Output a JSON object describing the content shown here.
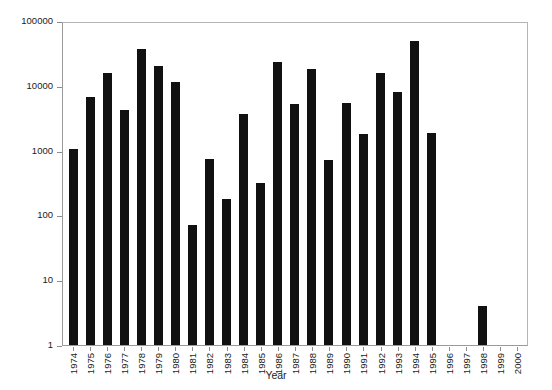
{
  "chart_data": {
    "type": "bar",
    "title": "",
    "xlabel": "Year",
    "ylabel": "Log total number collected",
    "yscale": "log",
    "ylim": [
      1,
      100000
    ],
    "ytick_labels": [
      "100000",
      "10000",
      "1000",
      "100",
      "10",
      "1"
    ],
    "ytick_values": [
      100000,
      10000,
      1000,
      100,
      10,
      1
    ],
    "grid": false,
    "legend": null,
    "bar_color": "#111111",
    "categories": [
      "1974",
      "1975",
      "1976",
      "1977",
      "1978",
      "1979",
      "1980",
      "1981",
      "1982",
      "1983",
      "1984",
      "1985",
      "1986",
      "1987",
      "1988",
      "1989",
      "1990",
      "1991",
      "1992",
      "1993",
      "1994",
      "1995",
      "1996",
      "1997",
      "1998",
      "1999",
      "2000"
    ],
    "values": [
      1050,
      6800,
      16000,
      4200,
      37000,
      20000,
      11500,
      70,
      750,
      180,
      3700,
      320,
      23000,
      5300,
      18000,
      720,
      5400,
      1800,
      16000,
      8000,
      50000,
      1850,
      0,
      0,
      4,
      0,
      0
    ]
  }
}
